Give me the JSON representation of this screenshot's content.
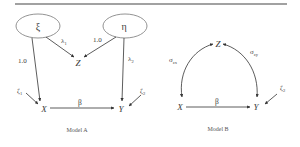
{
  "figure": {
    "rule_color": "#444444",
    "line_color": "#333333"
  },
  "model_a": {
    "caption": "Model A",
    "latent": {
      "xi": "ξ",
      "eta": "η"
    },
    "observed": {
      "x": "X",
      "z": "Z",
      "y": "Y"
    },
    "paths": {
      "xi_to_x": "1.0",
      "xi_to_z": "λ",
      "xi_to_z_sub": "1",
      "eta_to_z": "1.0",
      "eta_to_y": "λ",
      "eta_to_y_sub": "2",
      "x_to_y": "β"
    },
    "errors": {
      "zeta1": "ζ",
      "zeta1_sub": "1",
      "zeta2": "ζ",
      "zeta2_sub": "2"
    }
  },
  "model_b": {
    "caption": "Model B",
    "observed": {
      "x": "X",
      "z": "Z",
      "y": "Y"
    },
    "paths": {
      "sigma_zx": "σ",
      "sigma_zx_sub": "zx",
      "sigma_zy": "σ",
      "sigma_zy_sub": "zy",
      "x_to_y": "β"
    },
    "errors": {
      "zeta2": "ζ",
      "zeta2_sub": "2"
    }
  }
}
